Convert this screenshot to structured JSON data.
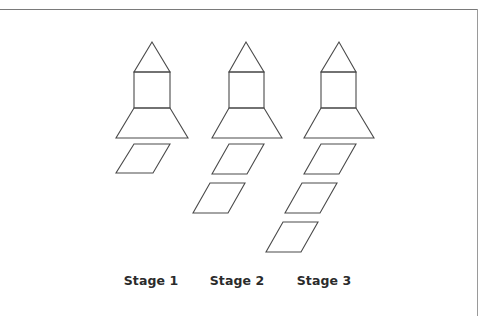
{
  "figure": {
    "title": "",
    "stroke_color": "#4a4a4a",
    "stages": [
      {
        "label": "Stage 1",
        "parallelograms": 1
      },
      {
        "label": "Stage 2",
        "parallelograms": 2
      },
      {
        "label": "Stage 3",
        "parallelograms": 3
      }
    ]
  }
}
